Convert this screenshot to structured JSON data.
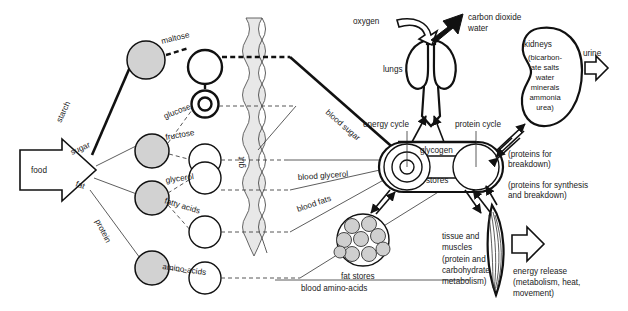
{
  "diagram": {
    "input": {
      "label": "food"
    },
    "food_branches": [
      {
        "name": "starch-branch",
        "label": "starch"
      },
      {
        "name": "sugar-branch",
        "label": "sugar"
      },
      {
        "name": "fat-branch",
        "label": "fat"
      },
      {
        "name": "protein-branch",
        "label": "protein"
      }
    ],
    "digestion_products": [
      {
        "name": "maltose",
        "label": "maltose"
      },
      {
        "name": "glucose",
        "label": "glucose"
      },
      {
        "name": "fructose",
        "label": "fructose"
      },
      {
        "name": "glycerol",
        "label": "glycerol"
      },
      {
        "name": "fatty-acids",
        "label": "fatty acids"
      },
      {
        "name": "amino-acids",
        "label": "amino-acids"
      }
    ],
    "gut": {
      "label": "gut"
    },
    "blood_transport": [
      {
        "name": "blood-sugar",
        "label": "blood sugar"
      },
      {
        "name": "blood-glycerol",
        "label": "blood glycerol"
      },
      {
        "name": "blood-fats",
        "label": "blood fats"
      },
      {
        "name": "blood-amino-acids",
        "label": "blood amino-acids"
      }
    ],
    "liver": {
      "energy_cycle": "energy cycle",
      "protein_cycle": "protein cycle",
      "glycogen": "glycogen",
      "stores": "stores"
    },
    "lungs": {
      "label": "lungs",
      "intake": "oxygen",
      "output_line1": "carbon dioxide",
      "output_line2": "water"
    },
    "kidneys": {
      "label": "kidneys",
      "contents_line1": "(bicarbon-",
      "contents_line2": "ate salts",
      "contents_line3": "water",
      "contents_line4": "minerals",
      "contents_line5": "ammonia",
      "contents_line6": "urea)",
      "output": "urine"
    },
    "fat_stores": {
      "label": "fat stores",
      "globule_count": 9
    },
    "tissue": {
      "line1": "tissue and",
      "line2": "muscles",
      "line3": "(protein and",
      "line4": "carbohydrate",
      "line5": "metabolism)"
    },
    "protein_flows": {
      "breakdown_line1": "(proteins for",
      "breakdown_line2": "breakdown)",
      "synthesis_line1": "(proteins for synthesis",
      "synthesis_line2": "and breakdown)"
    },
    "energy_release": {
      "line1": "energy release",
      "line2": "(metabolism, heat,",
      "line3": "movement)"
    },
    "colors": {
      "ink": "#111111",
      "node_fill": "#d2d2d2",
      "gut_fill": "#e8e8e8",
      "background": "#ffffff"
    }
  }
}
